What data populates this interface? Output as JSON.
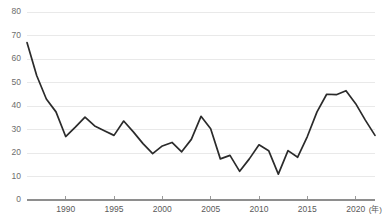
{
  "chart_data": {
    "type": "line",
    "title": "",
    "xlabel": "年",
    "ylabel": "",
    "xlim": [
      1986,
      2022
    ],
    "ylim": [
      0,
      80
    ],
    "grid": true,
    "legend": null,
    "x_ticks": [
      "1990",
      "1995",
      "2000",
      "2005",
      "2010",
      "2015",
      "2020"
    ],
    "x_tick_values": [
      1990,
      1995,
      2000,
      2005,
      2010,
      2015,
      2020
    ],
    "y_ticks": [
      "0",
      "10",
      "20",
      "30",
      "40",
      "50",
      "60",
      "70",
      "80"
    ],
    "y_tick_values": [
      0,
      10,
      20,
      30,
      40,
      50,
      60,
      70,
      80
    ],
    "x": [
      1986,
      1987,
      1988,
      1989,
      1990,
      1991,
      1992,
      1993,
      1994,
      1995,
      1996,
      1997,
      1998,
      1999,
      2000,
      2001,
      2002,
      2003,
      2004,
      2005,
      2006,
      2007,
      2008,
      2009,
      2010,
      2011,
      2012,
      2013,
      2014,
      2015,
      2016,
      2017,
      2018,
      2019,
      2020,
      2021,
      2022
    ],
    "values": [
      67.0,
      53.0,
      43.0,
      37.5,
      27.0,
      31.0,
      35.3,
      31.5,
      29.5,
      27.5,
      33.6,
      29.0,
      24.0,
      19.7,
      23.0,
      24.5,
      20.5,
      25.8,
      35.6,
      30.3,
      17.5,
      19.0,
      12.2,
      17.5,
      23.5,
      21.0,
      11.0,
      21.0,
      18.2,
      27.0,
      37.5,
      45.0,
      44.8,
      46.5,
      41.0,
      34.0,
      27.5
    ],
    "series_name": "",
    "series_color": "#2b2b2b",
    "grid_color": "#e9e9e9",
    "axis_color": "#8e8e8e"
  },
  "axis": {
    "x_unit_suffix": "(年)"
  },
  "caption": {
    "text": ""
  }
}
